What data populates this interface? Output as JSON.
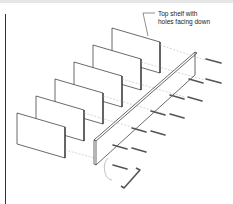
{
  "diagram": {
    "callout": {
      "line1": "Top shelf with",
      "line2": "holes facing down"
    },
    "parts": {
      "shelf_count": 6,
      "side_panel": "side-panel",
      "dowels": "dowel-pins",
      "tool": "allen-key"
    },
    "colors": {
      "line": "#333333",
      "panel_fill": "#ffffff",
      "dowel_band": "#555555"
    }
  }
}
